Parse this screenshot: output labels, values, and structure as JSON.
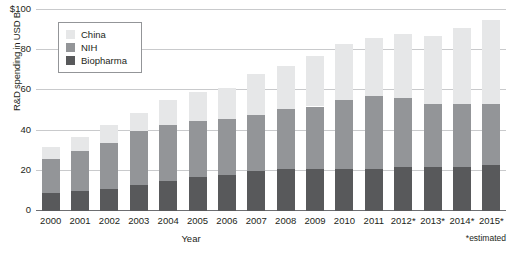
{
  "chart_data": {
    "type": "bar",
    "subtype": "stacked-bar",
    "title": "",
    "xlabel": "Year",
    "ylabel": "R&D spending in USD B",
    "ylim": [
      0,
      100
    ],
    "yticks": [
      0,
      20,
      40,
      60,
      80,
      100
    ],
    "ytick_labels": [
      "0",
      "20",
      "40",
      "60",
      "80",
      "$100"
    ],
    "grid": true,
    "legend_position": "upper-left-inside",
    "footnote": "*estimated",
    "categories": [
      "2000",
      "2001",
      "2002",
      "2003",
      "2004",
      "2005",
      "2006",
      "2007",
      "2008",
      "2009",
      "2010",
      "2011",
      "2012*",
      "2013*",
      "2014*",
      "2015*"
    ],
    "series": [
      {
        "name": "Biopharma",
        "color": "#58595b",
        "values": [
          9,
          10,
          11,
          13,
          15,
          17,
          18,
          20,
          21,
          21,
          21,
          21,
          22,
          22,
          22,
          23
        ]
      },
      {
        "name": "NIH",
        "color": "#939598",
        "values": [
          17,
          20,
          23,
          27,
          28,
          28,
          28,
          28,
          30,
          31,
          34,
          36,
          34,
          31,
          31,
          30
        ]
      },
      {
        "name": "China",
        "color": "#e6e7e8",
        "values": [
          6,
          7,
          9,
          9,
          12,
          14,
          15,
          20,
          21,
          25,
          28,
          29,
          32,
          34,
          38,
          42
        ]
      }
    ],
    "totals": [
      32,
      37,
      43,
      49,
      55,
      59,
      61,
      68,
      72,
      77,
      83,
      86,
      88,
      87,
      91,
      95
    ]
  },
  "legend": {
    "items": [
      {
        "label": "China",
        "color": "#e6e7e8"
      },
      {
        "label": "NIH",
        "color": "#939598"
      },
      {
        "label": "Biopharma",
        "color": "#58595b"
      }
    ]
  }
}
